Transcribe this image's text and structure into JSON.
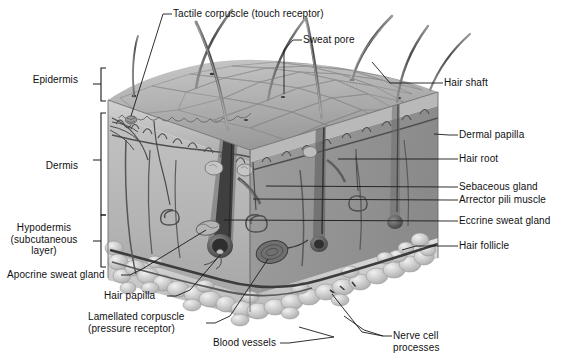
{
  "figure": {
    "type": "labeled-anatomical-illustration",
    "background_color": "#ffffff",
    "label_text_color": "#101010",
    "leader_line_color": "#1a1a1a"
  },
  "layer_brackets": [
    {
      "id": "epidermis",
      "label": "Epidermis",
      "side": "left",
      "label_x": 39,
      "label_y": 74,
      "bracket_x": 101,
      "bracket_top": 68,
      "bracket_bottom": 101
    },
    {
      "id": "dermis",
      "label": "Dermis",
      "side": "left",
      "label_x": 53,
      "label_y": 160,
      "bracket_x": 101,
      "bracket_top": 113,
      "bracket_bottom": 215
    },
    {
      "id": "hypodermis",
      "label": "Hypodermis\n(subcutaneous\nlayer)",
      "side": "left",
      "label_x": 12,
      "label_y": 222,
      "bracket_x": 101,
      "bracket_top": 215,
      "bracket_bottom": 267
    }
  ],
  "callouts": [
    {
      "id": "tactile-corpuscle",
      "label": "Tactile corpuscle (touch receptor)",
      "side": "top",
      "text_x": 173,
      "text_y": 8,
      "dash_x1": 163,
      "dash_y1": 14,
      "dash_x2": 172,
      "dash_y2": 14,
      "line": [
        [
          163,
          14
        ],
        [
          130,
          110
        ]
      ]
    },
    {
      "id": "sweat-pore",
      "label": "Sweat pore",
      "side": "top",
      "text_x": 303,
      "text_y": 34,
      "dash_x1": 293,
      "dash_y1": 40,
      "dash_x2": 302,
      "dash_y2": 40,
      "line": [
        [
          293,
          40
        ],
        [
          283,
          50
        ],
        [
          283,
          96
        ]
      ]
    },
    {
      "id": "hair-shaft",
      "label": "Hair shaft",
      "side": "right",
      "text_x": 444,
      "text_y": 77,
      "dash_x1": 434,
      "dash_y1": 83,
      "dash_x2": 443,
      "dash_y2": 83,
      "line": [
        [
          434,
          83
        ],
        [
          386,
          83
        ],
        [
          374,
          64
        ]
      ]
    },
    {
      "id": "dermal-papilla",
      "label": "Dermal papilla",
      "side": "right",
      "text_x": 459,
      "text_y": 129,
      "dash_x1": 449,
      "dash_y1": 135,
      "dash_x2": 458,
      "dash_y2": 135,
      "line": [
        [
          449,
          135
        ],
        [
          436,
          135
        ]
      ]
    },
    {
      "id": "hair-root",
      "label": "Hair root",
      "side": "right",
      "text_x": 459,
      "text_y": 153,
      "dash_x1": 449,
      "dash_y1": 159,
      "dash_x2": 458,
      "dash_y2": 159,
      "line": [
        [
          449,
          159
        ],
        [
          340,
          159
        ]
      ]
    },
    {
      "id": "sebaceous-gland",
      "label": "Sebaceous gland",
      "side": "right",
      "text_x": 459,
      "text_y": 181,
      "dash_x1": 449,
      "dash_y1": 187,
      "dash_x2": 458,
      "dash_y2": 187,
      "line": [
        [
          449,
          187
        ],
        [
          268,
          187
        ]
      ]
    },
    {
      "id": "arrector-pili",
      "label": "Arrector pili muscle",
      "side": "right",
      "text_x": 459,
      "text_y": 194,
      "dash_x1": 449,
      "dash_y1": 200,
      "dash_x2": 458,
      "dash_y2": 200,
      "line": [
        [
          449,
          200
        ],
        [
          255,
          200
        ]
      ]
    },
    {
      "id": "eccrine-sweat-gland",
      "label": "Eccrine sweat gland",
      "side": "right",
      "text_x": 459,
      "text_y": 215,
      "dash_x1": 449,
      "dash_y1": 221,
      "dash_x2": 458,
      "dash_y2": 221,
      "line": [
        [
          449,
          221
        ],
        [
          225,
          221
        ]
      ]
    },
    {
      "id": "hair-follicle",
      "label": "Hair follicle",
      "side": "right",
      "text_x": 459,
      "text_y": 240,
      "dash_x1": 449,
      "dash_y1": 246,
      "dash_x2": 458,
      "dash_y2": 246,
      "line": [
        [
          449,
          246
        ],
        [
          418,
          246
        ],
        [
          404,
          250
        ]
      ]
    },
    {
      "id": "apocrine-sweat-gland",
      "label": "Apocrine sweat gland",
      "side": "left",
      "text_x": 7,
      "text_y": 269,
      "dash_x1": 121,
      "dash_y1": 275,
      "dash_x2": 130,
      "dash_y2": 275,
      "line": [
        [
          130,
          275
        ],
        [
          142,
          268
        ],
        [
          206,
          229
        ]
      ]
    },
    {
      "id": "hair-papilla",
      "label": "Hair papilla",
      "side": "left",
      "text_x": 104,
      "text_y": 290,
      "dash_x1": 167,
      "dash_y1": 296,
      "dash_x2": 176,
      "dash_y2": 296,
      "line": [
        [
          176,
          296
        ],
        [
          188,
          290
        ],
        [
          222,
          253
        ]
      ]
    },
    {
      "id": "lamellated-corpuscle",
      "label": "Lamellated corpuscle\n(pressure receptor)",
      "side": "left",
      "text_x": 88,
      "text_y": 317,
      "dash_x1": 206,
      "dash_y1": 323,
      "dash_x2": 215,
      "dash_y2": 323,
      "line": [
        [
          215,
          323
        ],
        [
          228,
          316
        ],
        [
          269,
          258
        ]
      ]
    },
    {
      "id": "blood-vessels",
      "label": "Blood vessels",
      "side": "bottom",
      "text_x": 213,
      "text_y": 337,
      "dash_x1": 280,
      "dash_y1": 343,
      "dash_x2": 289,
      "dash_y2": 343,
      "line": [
        [
          289,
          343
        ],
        [
          332,
          337
        ],
        [
          300,
          327
        ]
      ]
    },
    {
      "id": "nerve-cell-processes",
      "label": "Nerve cell\nprocesses",
      "side": "bottom",
      "text_x": 393,
      "text_y": 330,
      "dash_x1": 383,
      "dash_y1": 336,
      "dash_x2": 392,
      "dash_y2": 336,
      "line": [
        [
          383,
          336
        ],
        [
          365,
          330
        ],
        [
          348,
          318
        ]
      ]
    }
  ],
  "structures": {
    "epidermis_surface": "polygonal cobblestone keratinocyte pattern on top face",
    "hair_shafts_count": 7,
    "fat_lobules": "bubbly adipose lobules along lower hypodermis edge",
    "block_bounds": {
      "left": 105,
      "top": 62,
      "right": 440,
      "bottom": 320
    }
  }
}
